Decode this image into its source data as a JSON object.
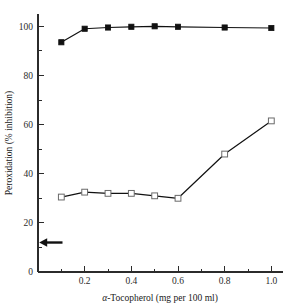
{
  "chart_data": {
    "type": "line",
    "title": "",
    "subtitle": "",
    "xlabel": "α-Tocopherol (mg per 100 ml)",
    "xlabel_italic_prefix": "α",
    "xlabel_rest": "-Tocopherol (mg per 100 ml)",
    "ylabel": "Peroxidation (% inhibition)",
    "xlim": [
      0,
      1.05
    ],
    "ylim": [
      0,
      105
    ],
    "grid": false,
    "legend_position": "none",
    "x_ticks_major": [
      0.2,
      0.4,
      0.6,
      0.8,
      1.0
    ],
    "x_tick_labels": [
      "0.2",
      "0.4",
      "0.6",
      "0.8",
      "1.0"
    ],
    "x_ticks_minor": [
      0.1,
      0.3,
      0.5,
      0.7,
      0.9
    ],
    "y_ticks_major": [
      0,
      20,
      40,
      60,
      80,
      100
    ],
    "y_tick_labels": [
      "0",
      "20",
      "40",
      "60",
      "80",
      "100"
    ],
    "y_ticks_minor": [
      10,
      30,
      50,
      70,
      90
    ],
    "x": [
      0.1,
      0.2,
      0.3,
      0.4,
      0.5,
      0.6,
      0.8,
      1.0
    ],
    "series": [
      {
        "name": "filled-square-series",
        "marker": "filled-square",
        "values": [
          93.5,
          99.0,
          99.5,
          99.8,
          100.0,
          99.8,
          99.5,
          99.3
        ]
      },
      {
        "name": "open-square-series",
        "marker": "open-square",
        "values": [
          30.5,
          32.5,
          32.0,
          32.0,
          31.0,
          30.0,
          48.0,
          61.5
        ]
      }
    ],
    "annotations": [
      {
        "name": "left-arrow-marker",
        "type": "arrow",
        "direction": "left",
        "y_value": 12.0,
        "x_start_value": 0.105,
        "x_end_value": 0.005
      }
    ]
  },
  "colors": {
    "axis": "#2b2b2b",
    "line": "#111111",
    "marker_filled": "#111111",
    "marker_open_stroke": "#6a6a6a",
    "marker_open_fill": "#ffffff",
    "background": "#ffffff",
    "annotation": "#111111"
  }
}
